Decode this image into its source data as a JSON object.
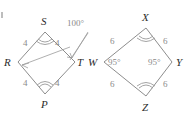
{
  "figure": {
    "stroke_color": "#8d8d8d",
    "label_color": "#2b2b2b",
    "measure_color": "#8a8a8a"
  },
  "left_shape": {
    "name": "rhombus-rstp",
    "vertices": [
      {
        "key": "S",
        "label": "S",
        "position": "top"
      },
      {
        "key": "T",
        "label": "T",
        "position": "right"
      },
      {
        "key": "P",
        "label": "P",
        "position": "bottom"
      },
      {
        "key": "R",
        "label": "R",
        "position": "left"
      }
    ],
    "side_labels": [
      {
        "key": "RS",
        "label": "4",
        "position": "upper-left"
      },
      {
        "key": "ST",
        "label": "4",
        "position": "upper-right"
      },
      {
        "key": "RP",
        "label": "4",
        "position": "lower-left"
      },
      {
        "key": "PT",
        "label": "4",
        "position": "lower-right"
      }
    ],
    "angle_labels": [
      {
        "key": "angle-100",
        "label": "100°",
        "points_to": [
          "S",
          "R"
        ]
      }
    ],
    "arc_marks": [
      {
        "vertex": "S",
        "ticks": 2
      },
      {
        "vertex": "P",
        "ticks": 2
      }
    ]
  },
  "right_shape": {
    "name": "rhombus-wxyz",
    "vertices": [
      {
        "key": "X",
        "label": "X",
        "position": "top"
      },
      {
        "key": "Y",
        "label": "Y",
        "position": "right"
      },
      {
        "key": "Z",
        "label": "Z",
        "position": "bottom"
      },
      {
        "key": "W",
        "label": "W",
        "position": "left"
      }
    ],
    "side_labels": [
      {
        "key": "WX",
        "label": "6",
        "position": "upper-left"
      },
      {
        "key": "XY",
        "label": "6",
        "position": "upper-right"
      },
      {
        "key": "WZ",
        "label": "6",
        "position": "lower-left"
      },
      {
        "key": "ZY",
        "label": "6",
        "position": "lower-right"
      }
    ],
    "angle_labels": [
      {
        "key": "angle-W",
        "label": "95°",
        "vertex": "W"
      },
      {
        "key": "angle-Y",
        "label": "95°",
        "vertex": "Y"
      }
    ],
    "arc_marks": [
      {
        "vertex": "X",
        "ticks": 2
      },
      {
        "vertex": "Z",
        "ticks": 2
      }
    ]
  }
}
